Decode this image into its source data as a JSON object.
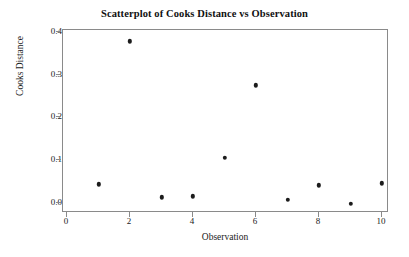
{
  "chart_data": {
    "type": "scatter",
    "title": "Scatterplot of Cooks Distance vs Observation",
    "xlabel": "Observation",
    "ylabel": "Cooks Distance",
    "x": [
      1,
      2,
      3,
      4,
      5,
      6,
      7,
      8,
      9,
      10
    ],
    "values": [
      0.044,
      0.378,
      0.013,
      0.016,
      0.105,
      0.275,
      0.008,
      0.041,
      -0.002,
      0.046
    ],
    "series": [
      {
        "name": "Cooks Distance",
        "points": [
          {
            "x": 1,
            "y": 0.044
          },
          {
            "x": 2,
            "y": 0.378
          },
          {
            "x": 3,
            "y": 0.013
          },
          {
            "x": 4,
            "y": 0.016
          },
          {
            "x": 5,
            "y": 0.105
          },
          {
            "x": 6,
            "y": 0.275
          },
          {
            "x": 7,
            "y": 0.008
          },
          {
            "x": 8,
            "y": 0.041
          },
          {
            "x": 9,
            "y": -0.002
          },
          {
            "x": 10,
            "y": 0.046
          }
        ]
      }
    ],
    "xlim": [
      -0.13,
      10.22
    ],
    "ylim": [
      -0.0235,
      0.4046
    ],
    "xticks": [
      0,
      2,
      4,
      6,
      8,
      10
    ],
    "xtick_labels": [
      "0",
      "2",
      "4",
      "6",
      "8",
      "10"
    ],
    "yticks": [
      0.0,
      0.1,
      0.2,
      0.3,
      0.4
    ],
    "ytick_labels": [
      "0.0",
      "0.1",
      "0.2",
      "0.3",
      "0.4"
    ],
    "grid": false,
    "legend": false,
    "marker_color": "#1c1c1c",
    "frame_color": "#8a8a8a",
    "background": "#ffffff"
  }
}
